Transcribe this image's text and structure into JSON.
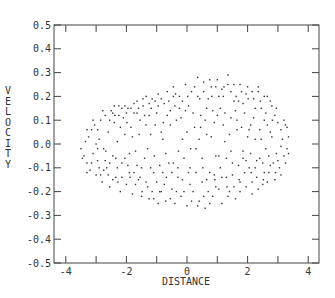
{
  "chart_data": {
    "type": "scatter",
    "title": "",
    "xlabel": "DISTANCE",
    "ylabel": "VELOCITY",
    "xlim": [
      -4.4,
      4.4
    ],
    "ylim": [
      -0.5,
      0.5
    ],
    "xticks": [
      -4,
      -2,
      0,
      2,
      4
    ],
    "xtick_labels": [
      "-4",
      "-2",
      "0",
      "2",
      "4"
    ],
    "xminor_ticks": [
      -4,
      -3,
      -2,
      -1,
      0,
      1,
      2,
      3,
      4
    ],
    "yticks": [
      0.5,
      0.4,
      0.3,
      0.2,
      0.1,
      0.0,
      -0.1,
      -0.2,
      -0.3,
      -0.4,
      -0.5
    ],
    "ytick_labels": [
      "0.5",
      "0.4",
      "0.3",
      "0.2",
      "0.1",
      "0.0",
      "-0.1",
      "-0.2",
      "-0.3",
      "-0.4",
      "-0.5"
    ],
    "grid": false,
    "legend": null,
    "marker_color": "#333333",
    "point_count_estimate": 400,
    "distribution": "elliptical cloud, x approx -3.5 to 3.4, y approx -0.28 to 0.30, sparser near center-left",
    "points": [
      [
        -3.5,
        -0.02
      ],
      [
        -3.4,
        -0.05
      ],
      [
        -3.3,
        -0.08
      ],
      [
        -3.35,
        0.01
      ],
      [
        -3.2,
        -0.11
      ],
      [
        -3.25,
        0.03
      ],
      [
        -3.1,
        -0.04
      ],
      [
        -3.15,
        0.06
      ],
      [
        -3.0,
        -0.13
      ],
      [
        -3.05,
        0.08
      ],
      [
        -2.9,
        0.02
      ],
      [
        -2.95,
        -0.07
      ],
      [
        -2.85,
        0.1
      ],
      [
        -2.8,
        -0.16
      ],
      [
        -2.75,
        -0.02
      ],
      [
        -2.7,
        0.12
      ],
      [
        -2.65,
        -0.1
      ],
      [
        -2.6,
        0.05
      ],
      [
        -2.55,
        -0.18
      ],
      [
        -2.5,
        0.14
      ],
      [
        -2.45,
        -0.05
      ],
      [
        -2.4,
        0.09
      ],
      [
        -2.35,
        -0.14
      ],
      [
        -2.3,
        0.01
      ],
      [
        -2.25,
        0.16
      ],
      [
        -2.2,
        -0.2
      ],
      [
        -2.15,
        -0.08
      ],
      [
        -2.1,
        0.11
      ],
      [
        -2.05,
        0.04
      ],
      [
        -2.0,
        -0.17
      ],
      [
        -1.95,
        0.15
      ],
      [
        -1.9,
        -0.12
      ],
      [
        -1.85,
        0.07
      ],
      [
        -1.8,
        -0.21
      ],
      [
        -1.75,
        0.13
      ],
      [
        -1.7,
        -0.03
      ],
      [
        -1.65,
        0.18
      ],
      [
        -1.6,
        -0.15
      ],
      [
        -1.55,
        0.1
      ],
      [
        -1.5,
        -0.22
      ],
      [
        -1.45,
        0.16
      ],
      [
        -1.4,
        -0.06
      ],
      [
        -1.35,
        0.2
      ],
      [
        -1.3,
        -0.18
      ],
      [
        -1.25,
        0.12
      ],
      [
        -1.2,
        -0.1
      ],
      [
        -1.15,
        0.19
      ],
      [
        -1.1,
        -0.23
      ],
      [
        -1.05,
        0.08
      ],
      [
        -1.0,
        -0.16
      ],
      [
        -0.95,
        0.21
      ],
      [
        -0.9,
        -0.2
      ],
      [
        -0.85,
        0.05
      ],
      [
        -0.8,
        -0.12
      ],
      [
        -0.75,
        0.17
      ],
      [
        -0.7,
        -0.24
      ],
      [
        -0.65,
        0.22
      ],
      [
        -0.6,
        -0.08
      ],
      [
        -0.55,
        0.14
      ],
      [
        -0.5,
        -0.19
      ],
      [
        -0.45,
        0.24
      ],
      [
        -0.4,
        -0.25
      ],
      [
        -0.35,
        0.1
      ],
      [
        -0.3,
        -0.14
      ],
      [
        -0.25,
        0.2
      ],
      [
        -0.2,
        -0.22
      ],
      [
        -0.15,
        0.02
      ],
      [
        -0.1,
        -0.06
      ],
      [
        -0.05,
        0.25
      ],
      [
        0.0,
        -0.26
      ],
      [
        0.05,
        0.16
      ],
      [
        0.1,
        -0.1
      ],
      [
        0.15,
        0.22
      ],
      [
        0.2,
        -0.2
      ],
      [
        0.25,
        0.07
      ],
      [
        0.3,
        -0.02
      ],
      [
        0.35,
        0.28
      ],
      [
        0.4,
        -0.24
      ],
      [
        0.45,
        0.12
      ],
      [
        0.5,
        -0.16
      ],
      [
        0.55,
        0.26
      ],
      [
        0.6,
        -0.27
      ],
      [
        0.65,
        0.04
      ],
      [
        0.7,
        0.19
      ],
      [
        0.75,
        -0.12
      ],
      [
        0.8,
        0.24
      ],
      [
        0.85,
        -0.22
      ],
      [
        0.9,
        0.09
      ],
      [
        0.95,
        -0.05
      ],
      [
        1.0,
        0.27
      ],
      [
        1.05,
        -0.19
      ],
      [
        1.1,
        0.15
      ],
      [
        1.15,
        -0.25
      ],
      [
        1.2,
        0.2
      ],
      [
        1.25,
        0.01
      ],
      [
        1.3,
        -0.14
      ],
      [
        1.35,
        0.29
      ],
      [
        1.4,
        -0.2
      ],
      [
        1.45,
        0.11
      ],
      [
        1.5,
        -0.08
      ],
      [
        1.55,
        0.25
      ],
      [
        1.6,
        -0.23
      ],
      [
        1.65,
        0.06
      ],
      [
        1.7,
        0.18
      ],
      [
        1.75,
        -0.16
      ],
      [
        1.8,
        0.22
      ],
      [
        1.85,
        -0.03
      ],
      [
        1.9,
        0.13
      ],
      [
        1.95,
        -0.18
      ],
      [
        2.0,
        0.24
      ],
      [
        2.05,
        -0.1
      ],
      [
        2.1,
        0.08
      ],
      [
        2.15,
        -0.21
      ],
      [
        2.2,
        0.19
      ],
      [
        2.25,
        0.02
      ],
      [
        2.3,
        -0.14
      ],
      [
        2.35,
        0.22
      ],
      [
        2.4,
        -0.06
      ],
      [
        2.45,
        0.15
      ],
      [
        2.5,
        -0.17
      ],
      [
        2.55,
        0.1
      ],
      [
        2.6,
        -0.02
      ],
      [
        2.65,
        0.2
      ],
      [
        2.7,
        -0.12
      ],
      [
        2.75,
        0.05
      ],
      [
        2.8,
        0.16
      ],
      [
        2.85,
        -0.08
      ],
      [
        2.9,
        0.12
      ],
      [
        2.95,
        -0.04
      ],
      [
        3.0,
        0.09
      ],
      [
        3.05,
        -0.1
      ],
      [
        3.1,
        0.06
      ],
      [
        3.15,
        0.02
      ],
      [
        3.2,
        -0.05
      ],
      [
        3.25,
        0.08
      ],
      [
        3.3,
        -0.02
      ],
      [
        3.35,
        0.03
      ],
      [
        -3.3,
        -0.12
      ],
      [
        -3.1,
        0.1
      ],
      [
        -2.9,
        -0.1
      ],
      [
        -2.6,
        -0.13
      ],
      [
        -2.4,
        0.16
      ],
      [
        -2.2,
        0.07
      ],
      [
        -2.0,
        0.13
      ],
      [
        -1.8,
        0.03
      ],
      [
        -1.6,
        0.15
      ],
      [
        -1.4,
        0.12
      ],
      [
        -1.2,
        0.04
      ],
      [
        -1.0,
        0.13
      ],
      [
        -0.8,
        0.02
      ],
      [
        -0.6,
        0.18
      ],
      [
        -0.4,
        0.16
      ],
      [
        -0.2,
        0.11
      ],
      [
        0.0,
        0.05
      ],
      [
        0.2,
        0.13
      ],
      [
        0.4,
        0.02
      ],
      [
        0.6,
        0.1
      ],
      [
        0.8,
        0.03
      ],
      [
        1.0,
        0.12
      ],
      [
        1.2,
        0.08
      ],
      [
        1.4,
        0.04
      ],
      [
        1.6,
        0.14
      ],
      [
        1.8,
        0.07
      ],
      [
        2.0,
        0.03
      ],
      [
        2.2,
        0.11
      ],
      [
        2.4,
        0.06
      ],
      [
        2.6,
        0.13
      ],
      [
        2.8,
        0.03
      ],
      [
        3.0,
        -0.07
      ],
      [
        -1.9,
        -0.04
      ],
      [
        -1.5,
        -0.1
      ],
      [
        -1.1,
        -0.12
      ],
      [
        -0.7,
        -0.04
      ],
      [
        -0.3,
        -0.1
      ],
      [
        0.1,
        -0.17
      ],
      [
        0.5,
        -0.06
      ],
      [
        0.9,
        -0.13
      ],
      [
        1.3,
        -0.06
      ],
      [
        1.7,
        -0.09
      ],
      [
        2.1,
        -0.04
      ],
      [
        2.5,
        -0.08
      ],
      [
        2.9,
        -0.15
      ],
      [
        -2.7,
        -0.07
      ],
      [
        -2.3,
        -0.1
      ],
      [
        -1.7,
        -0.17
      ],
      [
        -1.3,
        -0.02
      ],
      [
        -0.9,
        -0.09
      ],
      [
        -0.5,
        -0.12
      ],
      [
        -0.1,
        -0.2
      ],
      [
        0.3,
        -0.12
      ],
      [
        0.7,
        -0.2
      ],
      [
        1.1,
        -0.1
      ],
      [
        1.5,
        -0.13
      ],
      [
        1.9,
        -0.12
      ],
      [
        2.3,
        -0.07
      ],
      [
        2.7,
        -0.05
      ],
      [
        3.1,
        -0.01
      ],
      [
        -0.15,
        0.18
      ],
      [
        0.25,
        0.24
      ],
      [
        0.65,
        0.15
      ],
      [
        1.05,
        0.2
      ],
      [
        1.45,
        0.22
      ],
      [
        1.85,
        0.17
      ],
      [
        2.25,
        0.15
      ],
      [
        2.65,
        0.08
      ],
      [
        -0.55,
        0.08
      ],
      [
        -0.95,
        0.16
      ],
      [
        -1.35,
        0.08
      ],
      [
        -1.75,
        0.17
      ],
      [
        -2.15,
        0.15
      ],
      [
        -2.55,
        0.1
      ],
      [
        -2.95,
        0.06
      ],
      [
        -0.35,
        -0.2
      ],
      [
        0.15,
        -0.24
      ],
      [
        0.55,
        -0.22
      ],
      [
        0.95,
        -0.18
      ],
      [
        1.35,
        -0.22
      ],
      [
        1.75,
        -0.2
      ],
      [
        2.15,
        -0.16
      ],
      [
        2.55,
        -0.12
      ],
      [
        -0.75,
        -0.17
      ],
      [
        -1.15,
        -0.2
      ],
      [
        -1.55,
        -0.14
      ],
      [
        -1.95,
        -0.09
      ],
      [
        -2.35,
        -0.06
      ],
      [
        -2.75,
        -0.11
      ],
      [
        -3.15,
        -0.08
      ],
      [
        0.02,
        0.2
      ],
      [
        0.42,
        0.19
      ],
      [
        0.82,
        0.2
      ],
      [
        1.22,
        0.24
      ],
      [
        1.62,
        0.2
      ],
      [
        2.02,
        0.19
      ],
      [
        2.42,
        0.18
      ],
      [
        2.82,
        0.1
      ],
      [
        -0.38,
        0.21
      ],
      [
        -0.78,
        0.09
      ],
      [
        -1.18,
        0.15
      ],
      [
        -1.58,
        0.04
      ],
      [
        -1.98,
        0.09
      ],
      [
        -2.38,
        0.12
      ],
      [
        -2.78,
        0.14
      ],
      [
        0.12,
        -0.02
      ],
      [
        0.52,
        -0.1
      ],
      [
        0.92,
        -0.15
      ],
      [
        1.32,
        -0.18
      ],
      [
        1.72,
        -0.15
      ],
      [
        2.12,
        -0.12
      ],
      [
        2.52,
        -0.15
      ],
      [
        2.92,
        -0.12
      ],
      [
        -0.28,
        -0.03
      ],
      [
        -0.68,
        -0.14
      ],
      [
        -1.08,
        -0.05
      ],
      [
        -1.48,
        -0.2
      ],
      [
        -1.88,
        -0.14
      ],
      [
        -2.28,
        -0.16
      ],
      [
        -2.68,
        -0.03
      ],
      [
        3.2,
        0.1
      ],
      [
        3.25,
        -0.08
      ],
      [
        3.1,
        -0.13
      ],
      [
        2.95,
        0.15
      ],
      [
        2.75,
        0.18
      ],
      [
        2.55,
        0.2
      ],
      [
        2.35,
        0.24
      ],
      [
        2.15,
        0.22
      ],
      [
        1.95,
        0.21
      ],
      [
        1.75,
        0.25
      ],
      [
        1.55,
        0.18
      ],
      [
        1.35,
        0.25
      ],
      [
        1.15,
        0.23
      ],
      [
        0.95,
        0.24
      ],
      [
        0.75,
        0.27
      ],
      [
        0.55,
        0.22
      ],
      [
        0.35,
        0.2
      ],
      [
        -0.05,
        0.14
      ],
      [
        -0.25,
        0.15
      ],
      [
        -0.45,
        0.2
      ],
      [
        -0.65,
        0.12
      ],
      [
        -0.85,
        0.19
      ],
      [
        -1.05,
        0.18
      ],
      [
        -1.25,
        0.17
      ],
      [
        -1.45,
        0.19
      ],
      [
        -1.65,
        0.13
      ],
      [
        -1.85,
        0.15
      ],
      [
        -2.05,
        0.16
      ],
      [
        -2.25,
        0.12
      ],
      [
        -2.45,
        0.13
      ],
      [
        0.05,
        -0.12
      ],
      [
        0.35,
        -0.26
      ],
      [
        0.75,
        -0.25
      ],
      [
        1.15,
        -0.14
      ],
      [
        1.55,
        -0.18
      ],
      [
        1.95,
        -0.07
      ],
      [
        2.35,
        -0.19
      ],
      [
        2.75,
        -0.09
      ],
      [
        -0.15,
        -0.15
      ],
      [
        -0.55,
        -0.23
      ],
      [
        -0.95,
        -0.25
      ],
      [
        -1.35,
        -0.16
      ],
      [
        -1.75,
        -0.12
      ],
      [
        -2.15,
        -0.14
      ],
      [
        -2.55,
        -0.08
      ],
      [
        -2.95,
        -0.02
      ],
      [
        -3.3,
        0.06
      ],
      [
        -3.45,
        -0.06
      ],
      [
        3.3,
        0.07
      ],
      [
        3.35,
        -0.04
      ],
      [
        0.45,
        0.07
      ],
      [
        0.85,
        0.14
      ],
      [
        1.25,
        0.13
      ],
      [
        1.65,
        0.1
      ],
      [
        2.05,
        0.06
      ],
      [
        2.45,
        0.02
      ],
      [
        0.65,
        -0.15
      ],
      [
        1.05,
        -0.05
      ],
      [
        1.45,
        -0.03
      ],
      [
        1.85,
        -0.06
      ],
      [
        2.25,
        -0.1
      ],
      [
        2.65,
        -0.16
      ],
      [
        -0.45,
        -0.08
      ],
      [
        -0.85,
        -0.2
      ],
      [
        -1.25,
        -0.23
      ],
      [
        -1.65,
        -0.09
      ],
      [
        -2.05,
        -0.06
      ],
      [
        -2.45,
        -0.15
      ],
      [
        -2.85,
        -0.13
      ],
      [
        -3.0,
        0.0
      ]
    ]
  }
}
